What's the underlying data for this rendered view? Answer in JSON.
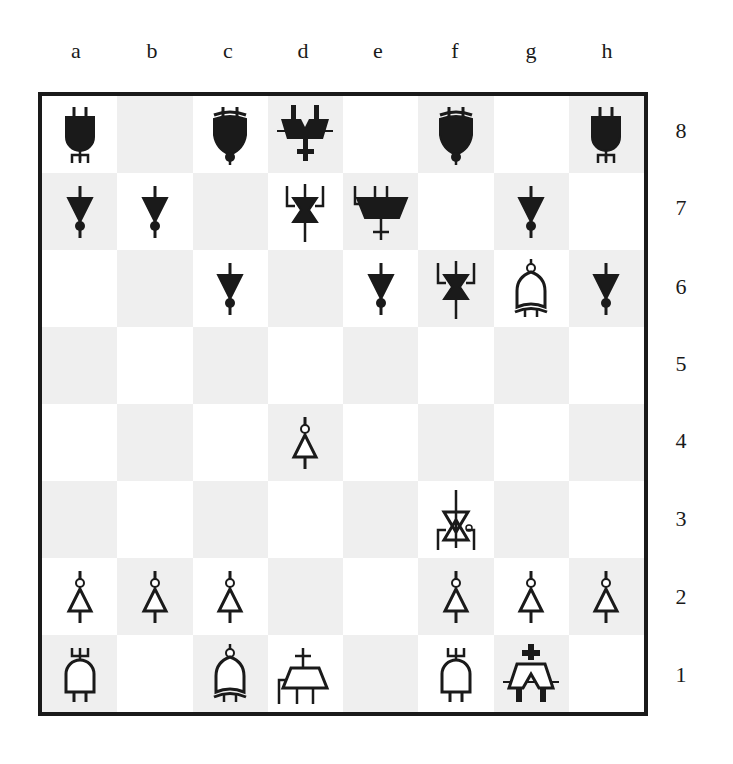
{
  "colors": {
    "light_square": "#ffffff",
    "dark_square": "#efefef",
    "ink": "#1a1a1a"
  },
  "files": [
    "a",
    "b",
    "c",
    "d",
    "e",
    "f",
    "g",
    "h"
  ],
  "ranks": [
    "8",
    "7",
    "6",
    "5",
    "4",
    "3",
    "2",
    "1"
  ],
  "pieces": [
    {
      "square": "a8",
      "color": "black",
      "type": "rook",
      "glyph": "and-gate-trident"
    },
    {
      "square": "c8",
      "color": "black",
      "type": "bishop",
      "glyph": "xnor-gate"
    },
    {
      "square": "d8",
      "color": "black",
      "type": "king",
      "glyph": "double-trapezoid-cross"
    },
    {
      "square": "f8",
      "color": "black",
      "type": "bishop",
      "glyph": "xnor-gate"
    },
    {
      "square": "h8",
      "color": "black",
      "type": "rook",
      "glyph": "and-gate-trident"
    },
    {
      "square": "a7",
      "color": "black",
      "type": "pawn",
      "glyph": "not-gate"
    },
    {
      "square": "b7",
      "color": "black",
      "type": "pawn",
      "glyph": "not-gate"
    },
    {
      "square": "d7",
      "color": "black",
      "type": "knight",
      "glyph": "hourglass-bracket"
    },
    {
      "square": "e7",
      "color": "black",
      "type": "queen",
      "glyph": "trapezoid-cross"
    },
    {
      "square": "g7",
      "color": "black",
      "type": "pawn",
      "glyph": "not-gate"
    },
    {
      "square": "c6",
      "color": "black",
      "type": "pawn",
      "glyph": "not-gate"
    },
    {
      "square": "e6",
      "color": "black",
      "type": "pawn",
      "glyph": "not-gate"
    },
    {
      "square": "f6",
      "color": "black",
      "type": "knight",
      "glyph": "hourglass-bracket"
    },
    {
      "square": "g6",
      "color": "white",
      "type": "bishop",
      "glyph": "xnor-gate"
    },
    {
      "square": "h6",
      "color": "black",
      "type": "pawn",
      "glyph": "not-gate"
    },
    {
      "square": "d4",
      "color": "white",
      "type": "pawn",
      "glyph": "not-gate"
    },
    {
      "square": "f3",
      "color": "white",
      "type": "knight",
      "glyph": "hourglass-bracket"
    },
    {
      "square": "a2",
      "color": "white",
      "type": "pawn",
      "glyph": "not-gate"
    },
    {
      "square": "b2",
      "color": "white",
      "type": "pawn",
      "glyph": "not-gate"
    },
    {
      "square": "c2",
      "color": "white",
      "type": "pawn",
      "glyph": "not-gate"
    },
    {
      "square": "f2",
      "color": "white",
      "type": "pawn",
      "glyph": "not-gate"
    },
    {
      "square": "g2",
      "color": "white",
      "type": "pawn",
      "glyph": "not-gate"
    },
    {
      "square": "h2",
      "color": "white",
      "type": "pawn",
      "glyph": "not-gate"
    },
    {
      "square": "a1",
      "color": "white",
      "type": "rook",
      "glyph": "and-gate-trident"
    },
    {
      "square": "c1",
      "color": "white",
      "type": "bishop",
      "glyph": "xnor-gate"
    },
    {
      "square": "d1",
      "color": "white",
      "type": "queen",
      "glyph": "trapezoid-cross"
    },
    {
      "square": "f1",
      "color": "white",
      "type": "rook",
      "glyph": "and-gate-trident"
    },
    {
      "square": "g1",
      "color": "white",
      "type": "king",
      "glyph": "double-trapezoid-cross"
    }
  ]
}
